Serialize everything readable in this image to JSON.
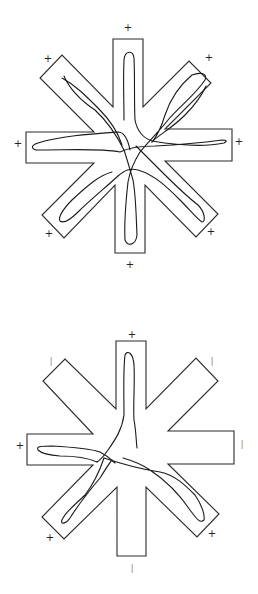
{
  "figure": {
    "colors": {
      "outline": "#2a2a2a",
      "track": "#1a1a1a",
      "marker": "#222222",
      "background": "#ffffff"
    }
  },
  "mazes": [
    {
      "id": "top",
      "center": [
        129,
        146
      ],
      "outline_points": "113,39 143,39 143,107 189,61 211,83 165,129 232,129 232,161 165,161 218,214 196,237 145,185 145,253 115,253 115,185 64,238 42,215 94,163 26,163 26,132 94,132 40,78 62,55 113,107",
      "markers": [
        {
          "arm": "N",
          "x": 128,
          "y": 28,
          "symbol": "+"
        },
        {
          "arm": "NE",
          "x": 209,
          "y": 58,
          "symbol": "+"
        },
        {
          "arm": "E",
          "x": 239,
          "y": 142,
          "symbol": "+"
        },
        {
          "arm": "SE",
          "x": 211,
          "y": 232,
          "symbol": "+"
        },
        {
          "arm": "S",
          "x": 130,
          "y": 265,
          "symbol": "+"
        },
        {
          "arm": "SW",
          "x": 49,
          "y": 234,
          "symbol": "+"
        },
        {
          "arm": "W",
          "x": 18,
          "y": 144,
          "symbol": "+"
        },
        {
          "arm": "NW",
          "x": 48,
          "y": 59,
          "symbol": "+"
        }
      ],
      "tracks": [
        "M 124,120 C 124,100 123,80 124,60 C 125,50 133,50 134,58 C 135,80 134,100 135,120 C 137,130 143,138 152,141 C 170,144 200,148 224,143 C 228,141 226,140 222,140 C 200,143 175,145 155,146 C 140,146 128,148 120,152 C 100,148 70,150 36,150 C 30,148 32,145 38,143 C 60,136 90,134 118,132 C 125,132 128,140 130,150",
        "M 64,76 C 70,90 80,100 95,110 C 108,122 118,138 124,150 C 128,162 130,170 133,180 C 136,196 136,215 137,235 C 136,245 128,247 125,240 C 124,220 126,200 128,182 C 130,170 135,160 140,152 C 150,140 162,128 168,120 C 178,108 195,95 205,80 C 208,73 200,72 192,75 C 180,85 170,100 165,115 C 162,125 158,135 152,142",
        "M 62,78 C 75,85 85,95 98,108 C 110,120 118,132 122,145",
        "M 112,172 C 100,175 88,185 72,200 C 62,210 58,218 60,221 C 64,224 70,220 78,212 C 90,200 105,188 118,176 C 125,170 130,168 138,170 C 155,175 168,188 180,200 C 190,210 198,220 202,222 C 206,222 205,212 198,205 C 185,195 172,182 160,170 C 150,160 142,152 136,146",
        "M 152,142 C 158,135 170,130 185,115 C 195,105 202,95 206,86"
      ]
    },
    {
      "id": "bottom",
      "center": [
        131,
        448
      ],
      "outline_points": "116,341 146,341 146,409 196,358 218,381 168,431 234,431 234,464 168,464 219,514 197,537 146,487 146,556 117,556 117,487 64,539 42,517 93,465 27,465 27,434 93,434 43,381 65,359 116,409",
      "markers": [
        {
          "arm": "N",
          "x": 132,
          "y": 335,
          "symbol": "+"
        },
        {
          "arm": "NE",
          "x": 212,
          "y": 361,
          "symbol": "-"
        },
        {
          "arm": "E",
          "x": 242,
          "y": 444,
          "symbol": "-"
        },
        {
          "arm": "SE",
          "x": 212,
          "y": 534,
          "symbol": "+"
        },
        {
          "arm": "S",
          "x": 132,
          "y": 568,
          "symbol": "-"
        },
        {
          "arm": "SW",
          "x": 50,
          "y": 538,
          "symbol": "+"
        },
        {
          "arm": "W",
          "x": 20,
          "y": 446,
          "symbol": "+"
        },
        {
          "arm": "NW",
          "x": 51,
          "y": 361,
          "symbol": "-"
        }
      ],
      "tracks": [
        "M 137,448 C 136,440 136,430 134,420 C 133,405 135,385 134,365 C 133,352 127,350 125,355 C 123,372 124,395 124,415 C 122,430 115,440 108,450 C 104,456 100,460 97,462",
        "M 97,462 C 88,458 75,456 60,456 C 45,455 40,452 38,450 C 36,446 42,446 52,446 C 70,447 88,448 100,452 C 108,456 112,460 115,463",
        "M 104,458 C 100,470 95,482 85,495 C 75,505 65,512 62,520 C 60,525 66,524 70,518 C 78,505 90,490 100,478 C 105,470 110,462 112,460",
        "M 104,458 C 125,465 145,470 160,472 C 175,475 185,485 195,495 C 202,505 205,515 204,520 C 200,524 196,518 190,510 C 180,495 165,480 150,470 C 140,463 130,460 123,458"
      ]
    }
  ]
}
